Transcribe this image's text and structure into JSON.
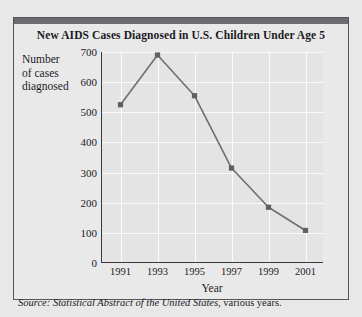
{
  "figure": {
    "title": "New AIDS Cases Diagnosed  in U.S. Children Under Age 5",
    "y_axis_title_line1": "Number",
    "y_axis_title_line2": "of cases",
    "y_axis_title_line3": "diagnosed",
    "source_prefix": "Source:",
    "source_italic": "Statistical Abstract of the United States",
    "source_suffix": ", various years.",
    "colors": {
      "page_background": "#e8e8e8",
      "figure_background": "#e9e9e9",
      "plot_background": "#e4e4e4",
      "gridline": "#fbfbfb",
      "axis": "#3a3a3e",
      "series_line": "#6e6e73",
      "series_marker": "#5e5e63",
      "top_rule": "#6b6b70",
      "text": "#1b1b1f"
    }
  },
  "chart_data": {
    "type": "line",
    "title": "New AIDS Cases Diagnosed  in U.S. Children Under Age 5",
    "xlabel": "Year",
    "ylabel": "Number of cases diagnosed",
    "categories": [
      "1991",
      "1993",
      "1995",
      "1997",
      "1999",
      "2001"
    ],
    "x": [
      1991,
      1993,
      1995,
      1997,
      1999,
      2001
    ],
    "values": [
      525,
      690,
      555,
      315,
      185,
      108
    ],
    "series": [
      {
        "name": "New AIDS cases diagnosed",
        "values": [
          525,
          690,
          555,
          315,
          185,
          108
        ]
      }
    ],
    "ylim": [
      0,
      700
    ],
    "xlim": [
      1990,
      2002
    ],
    "yticks": [
      0,
      100,
      200,
      300,
      400,
      500,
      600,
      700
    ],
    "ytick_labels": [
      "0",
      "100",
      "200",
      "300",
      "400",
      "500",
      "600",
      "700"
    ],
    "xticks": [
      1991,
      1993,
      1995,
      1997,
      1999,
      2001
    ],
    "xtick_labels": [
      "1991",
      "1993",
      "1995",
      "1997",
      "1999",
      "2001"
    ],
    "grid": true,
    "grid_axes": "both",
    "legend": false,
    "legend_position": "none",
    "marker": "square",
    "source": "Source: Statistical Abstract of the United States, various years."
  }
}
